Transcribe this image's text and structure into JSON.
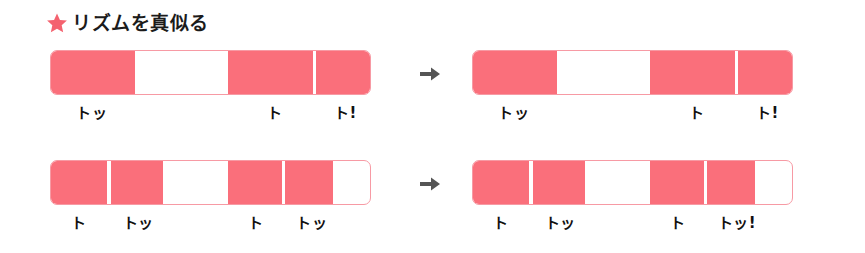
{
  "header": {
    "star_icon": "star-icon",
    "title": "リズムを真似る",
    "star_color": "#f4626f",
    "title_color": "#1b1b1b"
  },
  "colors": {
    "bar_fill": "#fa6f7b",
    "bar_border": "#f79aa4",
    "bar_empty": "#ffffff",
    "arrow": "#555555",
    "page_background": "#ffffff"
  },
  "arrow": {
    "icon": "arrow-right-icon",
    "glyph": "➜"
  },
  "rows": [
    {
      "id": "row-1",
      "left": {
        "name": "rhythm-bar-row1-before",
        "segments": [
          {
            "type": "filled",
            "start": 0.0,
            "width": 26.2
          },
          {
            "type": "empty",
            "start": 26.2,
            "width": 29.3
          },
          {
            "type": "filled",
            "start": 55.5,
            "width": 26.5
          },
          {
            "type": "divider",
            "start": 82.0,
            "width": 1.1
          },
          {
            "type": "filled",
            "start": 83.1,
            "width": 16.9
          }
        ],
        "labels": [
          {
            "text": "トッ",
            "pos": 13.0
          },
          {
            "text": "ト",
            "pos": 70.0
          },
          {
            "text": "ト!",
            "pos": 92.0
          }
        ]
      },
      "right": {
        "name": "rhythm-bar-row1-after",
        "segments": [
          {
            "type": "filled",
            "start": 0.0,
            "width": 26.2
          },
          {
            "type": "empty",
            "start": 26.2,
            "width": 29.3
          },
          {
            "type": "filled",
            "start": 55.5,
            "width": 26.5
          },
          {
            "type": "divider",
            "start": 82.0,
            "width": 1.1
          },
          {
            "type": "filled",
            "start": 83.1,
            "width": 16.9
          }
        ],
        "labels": [
          {
            "text": "トッ",
            "pos": 13.0
          },
          {
            "text": "ト",
            "pos": 70.0
          },
          {
            "text": "ト!",
            "pos": 92.0
          }
        ]
      }
    },
    {
      "id": "row-2",
      "left": {
        "name": "rhythm-bar-row2-before",
        "segments": [
          {
            "type": "filled",
            "start": 0.0,
            "width": 17.7
          },
          {
            "type": "divider",
            "start": 17.7,
            "width": 1.1
          },
          {
            "type": "filled",
            "start": 18.8,
            "width": 16.4
          },
          {
            "type": "empty",
            "start": 35.2,
            "width": 20.3
          },
          {
            "type": "filled",
            "start": 55.5,
            "width": 16.8
          },
          {
            "type": "divider",
            "start": 72.3,
            "width": 1.1
          },
          {
            "type": "filled",
            "start": 73.4,
            "width": 14.9
          },
          {
            "type": "empty",
            "start": 88.3,
            "width": 11.7
          }
        ],
        "labels": [
          {
            "text": "ト",
            "pos": 9.0
          },
          {
            "text": "トッ",
            "pos": 27.5
          },
          {
            "text": "ト",
            "pos": 64.0
          },
          {
            "text": "トッ",
            "pos": 81.5
          }
        ]
      },
      "right": {
        "name": "rhythm-bar-row2-after",
        "segments": [
          {
            "type": "filled",
            "start": 0.0,
            "width": 17.7
          },
          {
            "type": "divider",
            "start": 17.7,
            "width": 1.1
          },
          {
            "type": "filled",
            "start": 18.8,
            "width": 16.4
          },
          {
            "type": "empty",
            "start": 35.2,
            "width": 20.3
          },
          {
            "type": "filled",
            "start": 55.5,
            "width": 16.8
          },
          {
            "type": "divider",
            "start": 72.3,
            "width": 1.1
          },
          {
            "type": "filled",
            "start": 73.4,
            "width": 14.9
          },
          {
            "type": "empty",
            "start": 88.3,
            "width": 11.7
          }
        ],
        "labels": [
          {
            "text": "ト",
            "pos": 9.0
          },
          {
            "text": "トッ",
            "pos": 27.5
          },
          {
            "text": "ト",
            "pos": 64.0
          },
          {
            "text": "トッ!",
            "pos": 82.5
          }
        ]
      }
    }
  ]
}
